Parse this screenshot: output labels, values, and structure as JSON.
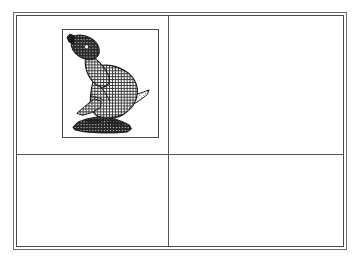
{
  "page": {
    "background_color": "#ffffff",
    "width": 359,
    "height": 261
  },
  "frame": {
    "name": "outer-double-border",
    "outer_line_color": "#6b6b6b",
    "inner_line_color": "#4a4a4a",
    "fill_color": "#ffffff"
  },
  "grid": {
    "divider_color": "#555555",
    "columns": 2,
    "rows": 2,
    "cells": [
      {
        "position": "top-left",
        "content": "picture",
        "label": ""
      },
      {
        "position": "top-right",
        "content": "empty",
        "label": ""
      },
      {
        "position": "bottom-left",
        "content": "empty",
        "label": ""
      },
      {
        "position": "bottom-right",
        "content": "empty",
        "label": ""
      }
    ]
  },
  "picture": {
    "name": "seal-illustration",
    "frame_color": "#4a4a4a",
    "background_color": "#ffffff",
    "ink_color": "#1a1a1a",
    "subject": "seal",
    "style": "halftone-dither-line-art",
    "description": "A seal (sea lion) with head raised upward to the left, seated on a dark rocky base, rendered in crosshatch halftone dithering",
    "parts": [
      {
        "name": "head",
        "shade": "dark"
      },
      {
        "name": "neck",
        "shade": "medium"
      },
      {
        "name": "body",
        "shade": "medium"
      },
      {
        "name": "front-flipper",
        "shade": "medium"
      },
      {
        "name": "rear-flipper",
        "shade": "medium"
      },
      {
        "name": "tail",
        "shade": "light"
      },
      {
        "name": "rock-base",
        "shade": "dark"
      }
    ]
  }
}
